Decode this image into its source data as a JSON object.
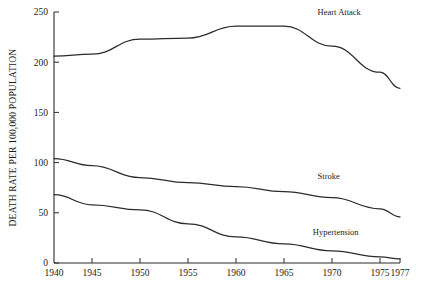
{
  "chart_data": {
    "type": "line",
    "title": "",
    "xlabel": "",
    "ylabel": "DEATH RATE PER 100,000 POPULATION",
    "x": [
      1940,
      1945,
      1950,
      1955,
      1960,
      1965,
      1970,
      1975,
      1977
    ],
    "xtick_labels": [
      "1940",
      "1945",
      "1950",
      "1955",
      "1960",
      "1965",
      "1970",
      "1975",
      "1977"
    ],
    "ytick_labels": [
      "0",
      "50",
      "100",
      "150",
      "200",
      "250"
    ],
    "yticks": [
      0,
      50,
      100,
      150,
      200,
      250
    ],
    "xlim": [
      1940,
      1977
    ],
    "ylim": [
      0,
      250
    ],
    "grid": false,
    "legend_position": "inline-annotations",
    "line_color": "#2b2b2b",
    "series": [
      {
        "name": "Heart Attack",
        "label": "Heart Attack",
        "values": [
          206,
          208,
          223,
          224,
          236,
          236,
          216,
          190,
          174
        ]
      },
      {
        "name": "Stroke",
        "label": "Stroke",
        "values": [
          104,
          97,
          85,
          80,
          76,
          71,
          65,
          54,
          46
        ]
      },
      {
        "name": "Hypertension",
        "label": "Hypertension",
        "values": [
          68,
          58,
          53,
          39,
          26,
          19,
          12,
          6,
          4
        ]
      }
    ],
    "annotations": [
      {
        "text": "Heart Attack",
        "x": 1968.5,
        "y": 247
      },
      {
        "text": "Stroke",
        "x": 1968.5,
        "y": 84
      },
      {
        "text": "Hypertension",
        "x": 1968.0,
        "y": 28
      }
    ]
  }
}
